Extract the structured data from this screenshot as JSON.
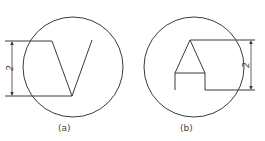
{
  "figure": {
    "panels": [
      {
        "id": "a",
        "caption": "(a)",
        "dimension_label": "2",
        "shape": "V"
      },
      {
        "id": "b",
        "caption": "(b)",
        "dimension_label": "2",
        "shape": "A"
      }
    ]
  },
  "colors": {
    "stroke": "#3a3a3a",
    "background": "#ffffff"
  }
}
